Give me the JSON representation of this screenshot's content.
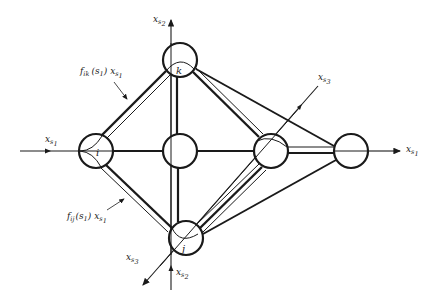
{
  "diagram": {
    "title": "",
    "colors": {
      "ink": "#1a1a1a",
      "background": "#ffffff"
    },
    "nodes": [
      {
        "id": "k",
        "label": "k",
        "cx": 180,
        "cy": 60,
        "r": 17
      },
      {
        "id": "i",
        "label": "i",
        "cx": 96,
        "cy": 151,
        "r": 17
      },
      {
        "id": "center",
        "label": "",
        "cx": 180,
        "cy": 151,
        "r": 17
      },
      {
        "id": "right-mid",
        "label": "",
        "cx": 271,
        "cy": 151,
        "r": 17
      },
      {
        "id": "far-right",
        "label": "",
        "cx": 351,
        "cy": 151,
        "r": 17
      },
      {
        "id": "j",
        "label": "j",
        "cx": 186,
        "cy": 238,
        "r": 17
      }
    ],
    "axes": {
      "xs1_left": {
        "base": "x",
        "sub": "s",
        "subsub": "1"
      },
      "xs1_right": {
        "base": "x",
        "sub": "s",
        "subsub": "1"
      },
      "xs2_top": {
        "base": "x",
        "sub": "s",
        "subsub": "2"
      },
      "xs2_bottom": {
        "base": "x",
        "sub": "s",
        "subsub": "2"
      },
      "xs3_top": {
        "base": "x",
        "sub": "s",
        "subsub": "3"
      },
      "xs3_bottom": {
        "base": "x",
        "sub": "s",
        "subsub": "3"
      }
    },
    "annotations": {
      "fik": {
        "f": "f",
        "fsub": "ik",
        "arg": "(s",
        "argsub": "1",
        "argclose": ")",
        "x": "x",
        "xsub": "s",
        "xsubsub": "1"
      },
      "fij": {
        "f": "f",
        "fsub": "ij",
        "arg": "(s",
        "argsub": "1",
        "argclose": ")",
        "x": "x",
        "xsub": "s",
        "xsubsub": "1"
      }
    }
  }
}
